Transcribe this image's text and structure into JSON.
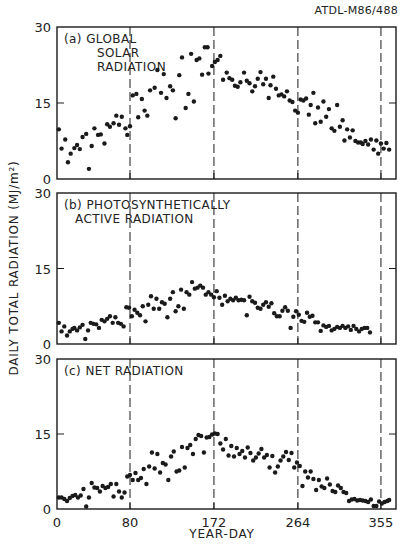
{
  "figure": {
    "reference": "ATDL-M86/488",
    "ylabel": "DAILY TOTAL RADIATION (MJ/m²)",
    "xlabel": "YEAR-DAY",
    "x_ticks": [
      0,
      80,
      172,
      264,
      355
    ],
    "x_tick_labels": [
      "0",
      "80",
      "172",
      "264",
      "355"
    ],
    "y_ticks": [
      0,
      15,
      30
    ],
    "y_tick_labels": [
      "0",
      "15",
      "30"
    ],
    "dashed_lines_at_days": [
      80,
      172,
      264,
      355
    ],
    "colors": {
      "ink": "#1a1a1a",
      "background": "#ffffff"
    }
  },
  "chart_data": [
    {
      "type": "scatter",
      "panel": "a",
      "title": "(a) GLOBAL SOLAR RADIATION",
      "title_lines": [
        "(a) GLOBAL",
        "SOLAR",
        "RADIATION"
      ],
      "xlabel": "YEAR-DAY",
      "ylabel": "DAILY TOTAL RADIATION (MJ/m²)",
      "xlim": [
        0,
        364
      ],
      "ylim": [
        0,
        30
      ],
      "points": [
        [
          2,
          9.8
        ],
        [
          5,
          6
        ],
        [
          9,
          7.8
        ],
        [
          12,
          3.3
        ],
        [
          15,
          5
        ],
        [
          19,
          6.1
        ],
        [
          22,
          6.7
        ],
        [
          25,
          5.9
        ],
        [
          28,
          8.3
        ],
        [
          32,
          8.9
        ],
        [
          35,
          2
        ],
        [
          38,
          6.5
        ],
        [
          41,
          10
        ],
        [
          45,
          8.7
        ],
        [
          48,
          8.8
        ],
        [
          52,
          7
        ],
        [
          55,
          10.8
        ],
        [
          58,
          10.3
        ],
        [
          62,
          11
        ],
        [
          65,
          12.5
        ],
        [
          68,
          10.7
        ],
        [
          71,
          12.3
        ],
        [
          75,
          10
        ],
        [
          77,
          8.7
        ],
        [
          80,
          10.4
        ],
        [
          83,
          16.5
        ],
        [
          87,
          16.8
        ],
        [
          89,
          12.2
        ],
        [
          93,
          15.8
        ],
        [
          96,
          13.5
        ],
        [
          99,
          12.5
        ],
        [
          102,
          17.5
        ],
        [
          107,
          18
        ],
        [
          110,
          21.5
        ],
        [
          114,
          17
        ],
        [
          117,
          20.7
        ],
        [
          120,
          16
        ],
        [
          124,
          18.3
        ],
        [
          127,
          17.5
        ],
        [
          130,
          12
        ],
        [
          134,
          20.5
        ],
        [
          137,
          24
        ],
        [
          141,
          14
        ],
        [
          144,
          16.8
        ],
        [
          147,
          24.7
        ],
        [
          150,
          15.3
        ],
        [
          153,
          23.5
        ],
        [
          156,
          23.8
        ],
        [
          159,
          20.6
        ],
        [
          162,
          26
        ],
        [
          165,
          26
        ],
        [
          166,
          20.8
        ],
        [
          170,
          22.3
        ],
        [
          173,
          23.1
        ],
        [
          176,
          23.5
        ],
        [
          179,
          24.3
        ],
        [
          182,
          19.6
        ],
        [
          186,
          21
        ],
        [
          189,
          19.9
        ],
        [
          192,
          19.6
        ],
        [
          195,
          18.4
        ],
        [
          198,
          18.2
        ],
        [
          201,
          19.1
        ],
        [
          205,
          21
        ],
        [
          208,
          19.4
        ],
        [
          211,
          18.9
        ],
        [
          214,
          17.3
        ],
        [
          217,
          18.3
        ],
        [
          220,
          19.8
        ],
        [
          223,
          21.1
        ],
        [
          226,
          18.7
        ],
        [
          229,
          19.8
        ],
        [
          232,
          16
        ],
        [
          234,
          18.5
        ],
        [
          237,
          20.2
        ],
        [
          240,
          17.8
        ],
        [
          243,
          16.5
        ],
        [
          246,
          16.7
        ],
        [
          249,
          16.3
        ],
        [
          252,
          17.3
        ],
        [
          255,
          15.5
        ],
        [
          258,
          15.2
        ],
        [
          261,
          13.5
        ],
        [
          264,
          13.1
        ],
        [
          267,
          15.7
        ],
        [
          270,
          15.5
        ],
        [
          273,
          15.9
        ],
        [
          276,
          12.7
        ],
        [
          278,
          14.6
        ],
        [
          281,
          17
        ],
        [
          283,
          11
        ],
        [
          286,
          14.1
        ],
        [
          289,
          11.3
        ],
        [
          292,
          15.3
        ],
        [
          295,
          12.3
        ],
        [
          298,
          13.8
        ],
        [
          301,
          10
        ],
        [
          304,
          9.5
        ],
        [
          307,
          14.6
        ],
        [
          310,
          10.3
        ],
        [
          313,
          11.6
        ],
        [
          315,
          7.6
        ],
        [
          318,
          9.8
        ],
        [
          321,
          8.2
        ],
        [
          324,
          9.6
        ],
        [
          327,
          7.5
        ],
        [
          330,
          7.2
        ],
        [
          333,
          7.2
        ],
        [
          335,
          6.9
        ],
        [
          338,
          7.5
        ],
        [
          341,
          6.8
        ],
        [
          344,
          7.8
        ],
        [
          347,
          5.8
        ],
        [
          350,
          7.6
        ],
        [
          352,
          5
        ],
        [
          355,
          7
        ],
        [
          358,
          6
        ],
        [
          361,
          7.1
        ],
        [
          364,
          5.8
        ]
      ]
    },
    {
      "type": "scatter",
      "panel": "b",
      "title": "(b) PHOTOSYNTHETICALLY ACTIVE RADIATION",
      "title_lines": [
        "(b) PHOTOSYNTHETICALLY",
        "ACTIVE RADIATION"
      ],
      "xlabel": "YEAR-DAY",
      "ylabel": "DAILY TOTAL RADIATION (MJ/m²)",
      "xlim": [
        0,
        364
      ],
      "ylim": [
        0,
        30
      ],
      "points": [
        [
          2,
          4.2
        ],
        [
          5,
          2.5
        ],
        [
          8,
          3.5
        ],
        [
          11,
          1.7
        ],
        [
          14,
          2.5
        ],
        [
          17,
          3
        ],
        [
          19,
          3.2
        ],
        [
          22,
          2.7
        ],
        [
          25,
          3.3
        ],
        [
          28,
          3.8
        ],
        [
          31,
          1
        ],
        [
          34,
          2.7
        ],
        [
          37,
          4.2
        ],
        [
          40,
          4
        ],
        [
          43,
          3.9
        ],
        [
          46,
          3.2
        ],
        [
          49,
          4.8
        ],
        [
          52,
          4.5
        ],
        [
          55,
          5
        ],
        [
          58,
          5.5
        ],
        [
          61,
          4.2
        ],
        [
          64,
          5.3
        ],
        [
          67,
          4.2
        ],
        [
          70,
          4
        ],
        [
          73,
          3.5
        ],
        [
          76,
          7.3
        ],
        [
          79,
          7.2
        ],
        [
          82,
          5.5
        ],
        [
          85,
          6.8
        ],
        [
          88,
          6.2
        ],
        [
          91,
          5.7
        ],
        [
          94,
          7.5
        ],
        [
          97,
          4.5
        ],
        [
          100,
          7.8
        ],
        [
          103,
          9.5
        ],
        [
          106,
          7
        ],
        [
          109,
          9
        ],
        [
          112,
          7
        ],
        [
          115,
          8.3
        ],
        [
          118,
          8
        ],
        [
          121,
          5.3
        ],
        [
          124,
          9
        ],
        [
          127,
          10.3
        ],
        [
          130,
          6.5
        ],
        [
          133,
          7.5
        ],
        [
          136,
          10.8
        ],
        [
          139,
          7
        ],
        [
          142,
          10.3
        ],
        [
          145,
          9.8
        ],
        [
          148,
          12.3
        ],
        [
          151,
          11
        ],
        [
          154,
          11.2
        ],
        [
          157,
          11.6
        ],
        [
          160,
          11.2
        ],
        [
          163,
          9.8
        ],
        [
          166,
          10.3
        ],
        [
          169,
          9.8
        ],
        [
          172,
          9.3
        ],
        [
          175,
          10.5
        ],
        [
          178,
          9.2
        ],
        [
          181,
          7.8
        ],
        [
          184,
          9.6
        ],
        [
          187,
          8.5
        ],
        [
          190,
          9
        ],
        [
          193,
          8.7
        ],
        [
          196,
          9.2
        ],
        [
          199,
          8.7
        ],
        [
          202,
          8.8
        ],
        [
          205,
          8.7
        ],
        [
          208,
          5.7
        ],
        [
          211,
          9.4
        ],
        [
          214,
          8.5
        ],
        [
          217,
          8.2
        ],
        [
          220,
          7.2
        ],
        [
          223,
          7
        ],
        [
          226,
          7.8
        ],
        [
          229,
          8.3
        ],
        [
          232,
          7.4
        ],
        [
          235,
          8.1
        ],
        [
          238,
          6.1
        ],
        [
          241,
          5.5
        ],
        [
          244,
          5.5
        ],
        [
          247,
          6.6
        ],
        [
          250,
          7.3
        ],
        [
          253,
          6.6
        ],
        [
          256,
          3.2
        ],
        [
          259,
          5.4
        ],
        [
          262,
          6.5
        ],
        [
          265,
          5.8
        ],
        [
          268,
          4.6
        ],
        [
          271,
          4.4
        ],
        [
          274,
          6.2
        ],
        [
          277,
          5.4
        ],
        [
          280,
          5.6
        ],
        [
          283,
          4.3
        ],
        [
          286,
          4.3
        ],
        [
          289,
          2.6
        ],
        [
          292,
          3.7
        ],
        [
          295,
          3.4
        ],
        [
          298,
          3.6
        ],
        [
          301,
          2.7
        ],
        [
          304,
          3
        ],
        [
          307,
          3.4
        ],
        [
          310,
          3.2
        ],
        [
          313,
          3.6
        ],
        [
          316,
          3.2
        ],
        [
          319,
          3.5
        ],
        [
          322,
          2.8
        ],
        [
          325,
          3.6
        ],
        [
          328,
          3
        ],
        [
          331,
          2.5
        ],
        [
          334,
          3
        ],
        [
          337,
          3.2
        ],
        [
          340,
          3.2
        ],
        [
          343,
          2.3
        ]
      ]
    },
    {
      "type": "scatter",
      "panel": "c",
      "title": "(c) NET RADIATION",
      "title_lines": [
        "(c) NET RADIATION"
      ],
      "xlabel": "YEAR-DAY",
      "ylabel": "DAILY TOTAL RADIATION (MJ/m²)",
      "xlim": [
        0,
        364
      ],
      "ylim": [
        0,
        30
      ],
      "points": [
        [
          2,
          2.3
        ],
        [
          5,
          2.3
        ],
        [
          8,
          2
        ],
        [
          11,
          1.6
        ],
        [
          14,
          2.2
        ],
        [
          17,
          2.6
        ],
        [
          20,
          2.8
        ],
        [
          23,
          2.3
        ],
        [
          26,
          2.7
        ],
        [
          29,
          4
        ],
        [
          32,
          0.5
        ],
        [
          35,
          2.3
        ],
        [
          38,
          5.2
        ],
        [
          41,
          4.3
        ],
        [
          44,
          4.2
        ],
        [
          47,
          3.5
        ],
        [
          50,
          4.6
        ],
        [
          53,
          4.2
        ],
        [
          56,
          4.4
        ],
        [
          59,
          5
        ],
        [
          62,
          2.5
        ],
        [
          65,
          5
        ],
        [
          68,
          3.5
        ],
        [
          71,
          2.3
        ],
        [
          74,
          3.3
        ],
        [
          77,
          6.5
        ],
        [
          80,
          6.8
        ],
        [
          83,
          5.8
        ],
        [
          86,
          7.2
        ],
        [
          89,
          5.8
        ],
        [
          92,
          6.2
        ],
        [
          95,
          8
        ],
        [
          98,
          5
        ],
        [
          101,
          8.5
        ],
        [
          104,
          11.3
        ],
        [
          107,
          8.1
        ],
        [
          110,
          11
        ],
        [
          113,
          7.3
        ],
        [
          116,
          9.2
        ],
        [
          119,
          8.9
        ],
        [
          122,
          5.8
        ],
        [
          125,
          10.5
        ],
        [
          128,
          11.5
        ],
        [
          131,
          7.5
        ],
        [
          134,
          7.7
        ],
        [
          137,
          12.4
        ],
        [
          140,
          8.3
        ],
        [
          143,
          12.2
        ],
        [
          146,
          12.8
        ],
        [
          149,
          11
        ],
        [
          152,
          14
        ],
        [
          155,
          14.8
        ],
        [
          158,
          14.6
        ],
        [
          161,
          11.3
        ],
        [
          164,
          14.3
        ],
        [
          167,
          14.4
        ],
        [
          170,
          14.9
        ],
        [
          173,
          15.1
        ],
        [
          176,
          15
        ],
        [
          179,
          13.1
        ],
        [
          182,
          11.9
        ],
        [
          185,
          14
        ],
        [
          188,
          10.7
        ],
        [
          191,
          12.6
        ],
        [
          194,
          10.5
        ],
        [
          197,
          12.2
        ],
        [
          200,
          11
        ],
        [
          203,
          11.6
        ],
        [
          206,
          10.3
        ],
        [
          209,
          12.3
        ],
        [
          212,
          11.2
        ],
        [
          215,
          9.7
        ],
        [
          218,
          10.3
        ],
        [
          221,
          11.1
        ],
        [
          224,
          12
        ],
        [
          227,
          10.3
        ],
        [
          230,
          10.8
        ],
        [
          233,
          8.3
        ],
        [
          236,
          10.6
        ],
        [
          239,
          7.3
        ],
        [
          242,
          8.5
        ],
        [
          245,
          9.7
        ],
        [
          248,
          10.5
        ],
        [
          251,
          11.4
        ],
        [
          254,
          9.8
        ],
        [
          257,
          11.2
        ],
        [
          260,
          8.3
        ],
        [
          263,
          9.3
        ],
        [
          266,
          8.6
        ],
        [
          269,
          4.6
        ],
        [
          272,
          7.5
        ],
        [
          275,
          6.3
        ],
        [
          278,
          7.5
        ],
        [
          281,
          6
        ],
        [
          284,
          3.8
        ],
        [
          287,
          5.8
        ],
        [
          290,
          4.5
        ],
        [
          293,
          4.2
        ],
        [
          296,
          6.1
        ],
        [
          299,
          4.9
        ],
        [
          302,
          3.6
        ],
        [
          305,
          3.4
        ],
        [
          308,
          4.7
        ],
        [
          311,
          4.2
        ],
        [
          314,
          3.4
        ],
        [
          317,
          3.2
        ],
        [
          320,
          1.6
        ],
        [
          323,
          1.9
        ],
        [
          326,
          2
        ],
        [
          329,
          1.7
        ],
        [
          332,
          1.8
        ],
        [
          335,
          1.7
        ],
        [
          338,
          1.6
        ],
        [
          341,
          1.4
        ],
        [
          344,
          1.9
        ],
        [
          347,
          0.6
        ],
        [
          350,
          0.6
        ],
        [
          353,
          1.5
        ],
        [
          356,
          1.1
        ],
        [
          359,
          1.4
        ],
        [
          362,
          1.6
        ],
        [
          364,
          1.8
        ]
      ]
    }
  ]
}
